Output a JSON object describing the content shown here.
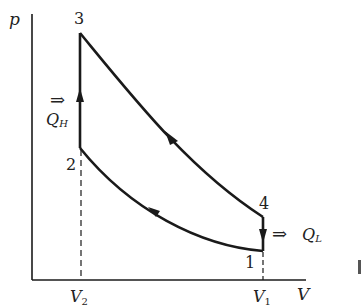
{
  "diagram": {
    "type": "p-V diagram (Otto cycle)",
    "axes": {
      "y_label": "p",
      "x_label": "V",
      "x_ticks": [
        {
          "main": "V",
          "sub": "2"
        },
        {
          "main": "V",
          "sub": "1"
        }
      ]
    },
    "points": [
      {
        "id": "1",
        "label": "1"
      },
      {
        "id": "2",
        "label": "2"
      },
      {
        "id": "3",
        "label": "3"
      },
      {
        "id": "4",
        "label": "4"
      }
    ],
    "heat": {
      "in": {
        "arrow": "⇒",
        "main": "Q",
        "sub": "H"
      },
      "out": {
        "arrow": "⇒",
        "main": "Q",
        "sub": "L"
      }
    },
    "colors": {
      "stroke": "#1a1a1a",
      "text": "#222222",
      "background": "#ffffff"
    }
  }
}
